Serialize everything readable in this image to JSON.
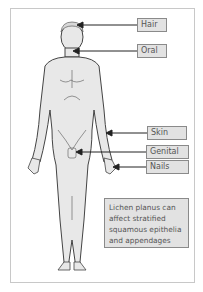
{
  "diagram": {
    "labels": [
      {
        "text": "Hair",
        "target": "scalp"
      },
      {
        "text": "Oral",
        "target": "mouth"
      },
      {
        "text": "Skin",
        "target": "forearm"
      },
      {
        "text": "Genital",
        "target": "genitals"
      },
      {
        "text": "Nails",
        "target": "fingernails"
      }
    ],
    "note": "Lichen planus can affect stratified squamous epithelia and appendages",
    "colors": {
      "body_fill": "#e8e8e8",
      "outline": "#444444",
      "label_bg": "#e2e2e2",
      "label_border": "#8a8a8a",
      "arrow": "#222222"
    }
  }
}
